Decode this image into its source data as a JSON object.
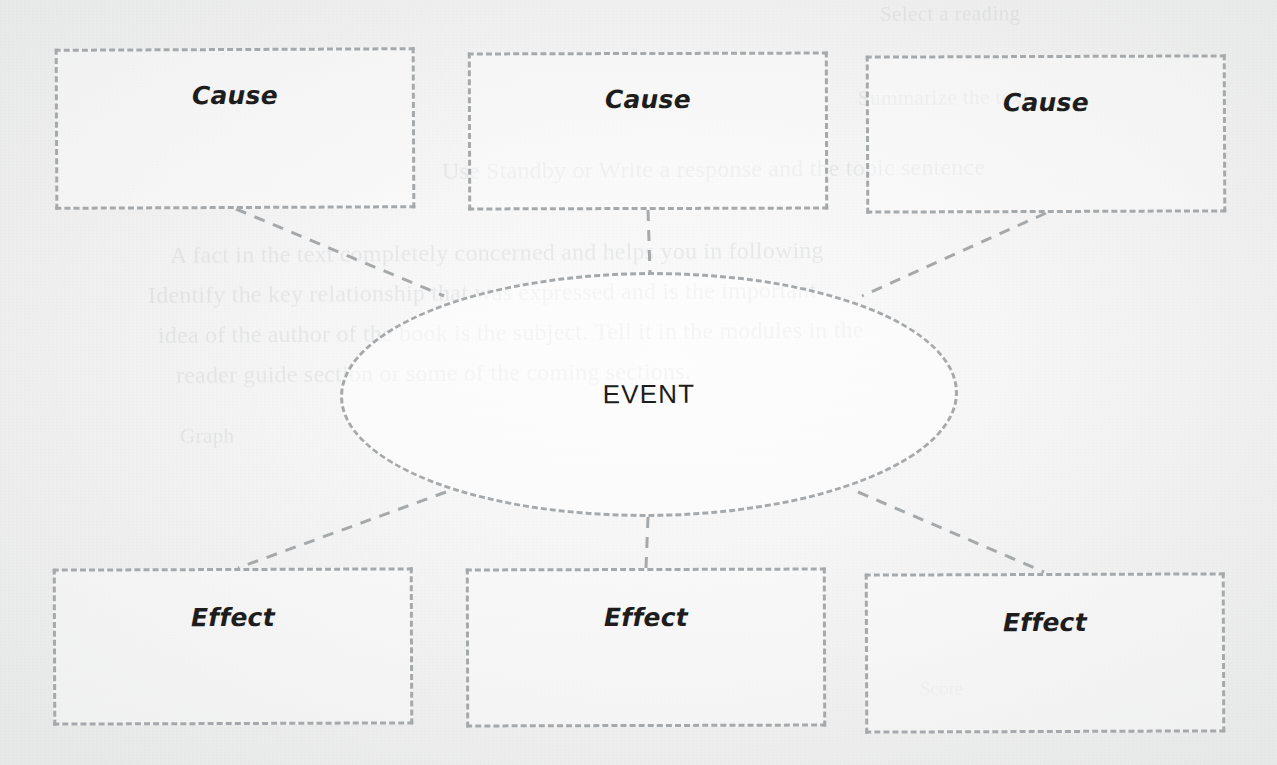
{
  "page": {
    "paper_color": "#f4f4f4",
    "ink_color": "#a6a9ab",
    "text_color": "#1d1d1d"
  },
  "organizer": {
    "causes": [
      {
        "label": "Cause",
        "content": ""
      },
      {
        "label": "Cause",
        "content": ""
      },
      {
        "label": "Cause",
        "content": ""
      }
    ],
    "event": {
      "label": "EVENT",
      "content": ""
    },
    "effects": [
      {
        "label": "Effect",
        "content": ""
      },
      {
        "label": "Effect",
        "content": ""
      },
      {
        "label": "Effect",
        "content": ""
      }
    ]
  },
  "bleed_through": {
    "note": "Faint reversed print showing through from the back of the scanned sheet; only partially legible.",
    "lines": [
      "Select a reading",
      "Summarize the text",
      "Use Standby or Write a response and the topic sentence",
      "A fact in the text completely concerned and helps you in following",
      "Identify the key relationship that was expressed and is the important",
      "idea of the author of the book is the subject. Tell it in the modules in the",
      "reader guide section or some of the coming sections.",
      "Graph",
      "Score"
    ]
  }
}
